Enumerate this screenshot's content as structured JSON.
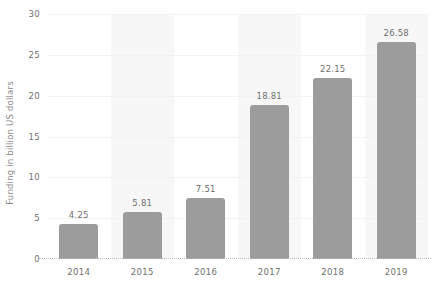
{
  "chart_data": {
    "type": "bar",
    "title": "",
    "xlabel": "",
    "ylabel": "Funding in billion US dollars",
    "categories": [
      "2014",
      "2015",
      "2016",
      "2017",
      "2018",
      "2019"
    ],
    "values": [
      4.25,
      5.81,
      7.51,
      18.81,
      22.15,
      26.58
    ],
    "value_labels": [
      "4.25",
      "5.81",
      "7.51",
      "18.81",
      "22.15",
      "26.58"
    ],
    "ylim": [
      0,
      30
    ],
    "yticks": [
      0,
      5,
      10,
      15,
      20,
      25,
      30
    ],
    "ytick_labels": [
      "0",
      "5",
      "10",
      "15",
      "20",
      "25",
      "30"
    ],
    "grid": true,
    "legend": "none",
    "series": [
      {
        "name": "Funding in billion US dollars",
        "values": [
          4.25,
          5.81,
          7.51,
          18.81,
          22.15,
          26.58
        ]
      }
    ],
    "colors": {
      "bar": "#9c9c9c",
      "band": "#f7f7f7",
      "gridline": "#f2f2f2",
      "axis": "#bdbdbd",
      "tick_text": "#6f6f6f",
      "axis_title_text": "#8a8a8a",
      "background": "#ffffff"
    },
    "banded_categories": [
      "2015",
      "2017",
      "2019"
    ]
  }
}
